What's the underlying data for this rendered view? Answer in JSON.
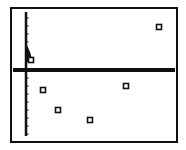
{
  "screen": {
    "frame": {
      "x": 11,
      "y": 8,
      "width": 166,
      "height": 134,
      "stroke": "#111111"
    },
    "axes_color": "#111111",
    "background": "#ffffff"
  },
  "chart_data": {
    "type": "scatter",
    "title": "",
    "xlabel": "",
    "ylabel": "",
    "grid": false,
    "legend": null,
    "marker": "open-square",
    "axis_origin_px": {
      "x": 26,
      "y": 70
    },
    "y_axis_ticks_px": [
      18,
      26,
      34,
      42,
      50,
      58,
      78,
      86,
      94,
      102,
      110,
      118,
      126,
      134
    ],
    "cluster": {
      "description": "dense cluster of points hugging the y-axis just above the x-axis",
      "px_polygon": [
        [
          27,
          45
        ],
        [
          27,
          62
        ],
        [
          33,
          62
        ],
        [
          30,
          52
        ]
      ]
    },
    "points_px": [
      {
        "x": 31,
        "y": 60
      },
      {
        "x": 43,
        "y": 90
      },
      {
        "x": 58,
        "y": 110
      },
      {
        "x": 90,
        "y": 120
      },
      {
        "x": 126,
        "y": 86
      },
      {
        "x": 159,
        "y": 27
      }
    ],
    "points_relative": [
      {
        "x": 0.3,
        "y": 0.6
      },
      {
        "x": 1.1,
        "y": -1.3
      },
      {
        "x": 2.1,
        "y": -2.5
      },
      {
        "x": 4.3,
        "y": -3.1
      },
      {
        "x": 6.7,
        "y": -1.0
      },
      {
        "x": 8.9,
        "y": 2.7
      }
    ]
  }
}
